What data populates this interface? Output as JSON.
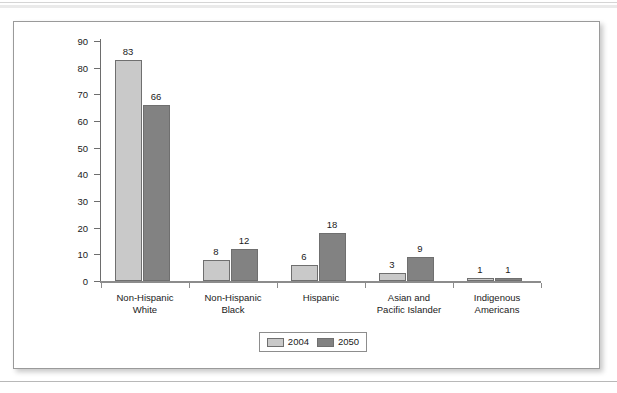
{
  "figure": {
    "frame_border_color": "#9a9a9a",
    "background": "#ffffff"
  },
  "chart_data": {
    "type": "bar",
    "title": "",
    "xlabel": "",
    "ylabel": "",
    "ylim": [
      0,
      90
    ],
    "yticks": [
      0,
      10,
      20,
      30,
      40,
      50,
      60,
      70,
      80,
      90
    ],
    "grid": false,
    "legend_position": "bottom-center",
    "categories": [
      "Non-Hispanic\nWhite",
      "Non-Hispanic\nBlack",
      "Hispanic",
      "Asian and\nPacific Islander",
      "Indigenous\nAmericans"
    ],
    "category_lines": [
      [
        "Non-Hispanic",
        "White"
      ],
      [
        "Non-Hispanic",
        "Black"
      ],
      [
        "Hispanic",
        ""
      ],
      [
        "Asian and",
        "Pacific Islander"
      ],
      [
        "Indigenous",
        "Americans"
      ]
    ],
    "series": [
      {
        "name": "2004",
        "color": "#c9c9c9",
        "values": [
          83,
          8,
          6,
          3,
          1
        ]
      },
      {
        "name": "2050",
        "color": "#828282",
        "values": [
          66,
          12,
          18,
          9,
          1
        ]
      }
    ],
    "data_labels": [
      [
        "83",
        "66"
      ],
      [
        "8",
        "12"
      ],
      [
        "6",
        "18"
      ],
      [
        "3",
        "9"
      ],
      [
        "1",
        "1"
      ]
    ]
  },
  "legend": {
    "items": [
      {
        "label": "2004",
        "color": "#c9c9c9"
      },
      {
        "label": "2050",
        "color": "#828282"
      }
    ]
  }
}
